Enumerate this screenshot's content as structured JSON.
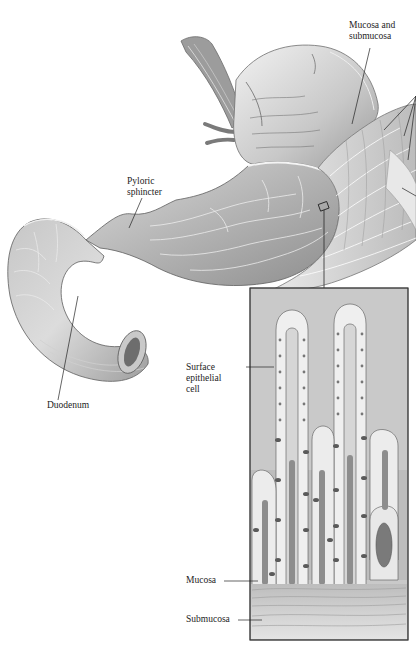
{
  "figure": {
    "colors": {
      "background": "#ffffff",
      "tissue_light": "#e2e2e2",
      "tissue_mid": "#b9b9b9",
      "tissue_dark": "#7d7d7d",
      "inset_bg": "#c9c9c9",
      "cell_light": "#f1f1f1",
      "cell_dark": "#5c5c5c",
      "line": "#2a2a2a"
    }
  },
  "labels": {
    "mucosa_submucosa": {
      "line1": "Mucosa and",
      "line2": "submucosa"
    },
    "pyloric_sphincter": {
      "line1": "Pyloric",
      "line2": "sphincter"
    },
    "surface_epithelial_cell": {
      "line1": "Surface",
      "line2": "epithelial",
      "line3": "cell"
    },
    "duodenum": {
      "text": "Duodenum"
    },
    "mucosa": {
      "text": "Mucosa"
    },
    "submucosa": {
      "text": "Submucosa"
    }
  },
  "inset": {
    "title": "Magnified gastric mucosa",
    "villi_count": 6
  }
}
